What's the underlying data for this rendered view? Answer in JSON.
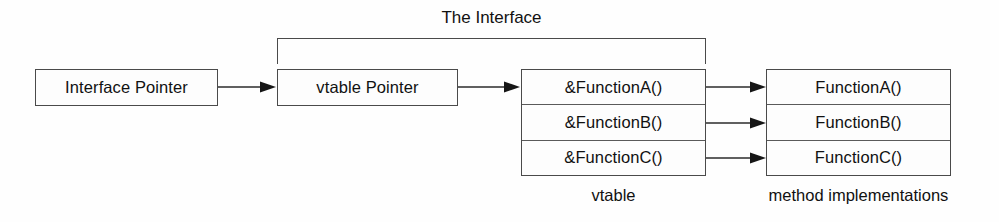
{
  "diagram": {
    "bracket": {
      "label": "The Interface"
    },
    "nodes": {
      "interface_pointer": {
        "label": "Interface Pointer"
      },
      "vtable_pointer": {
        "label": "vtable Pointer"
      },
      "vtable": {
        "caption": "vtable",
        "rows": [
          {
            "label": "&FunctionA()"
          },
          {
            "label": "&FunctionB()"
          },
          {
            "label": "&FunctionC()"
          }
        ]
      },
      "method_implementations": {
        "caption": "method implementations",
        "rows": [
          {
            "label": "FunctionA()"
          },
          {
            "label": "FunctionB()"
          },
          {
            "label": "FunctionC()"
          }
        ]
      }
    },
    "connectors": [
      {
        "name": "interface-pointer-to-vtable-pointer"
      },
      {
        "name": "vtable-pointer-to-vtable"
      },
      {
        "name": "vtable-row-a-to-function-a"
      },
      {
        "name": "vtable-row-b-to-function-b"
      },
      {
        "name": "vtable-row-c-to-function-c"
      }
    ],
    "colors": {
      "background": "#fefefe",
      "box_fill": "#fdfdfd",
      "stroke": "#4a4a4a",
      "divider": "#5a5a5a",
      "text": "#111111",
      "arrow": "#2b2b2b"
    }
  }
}
